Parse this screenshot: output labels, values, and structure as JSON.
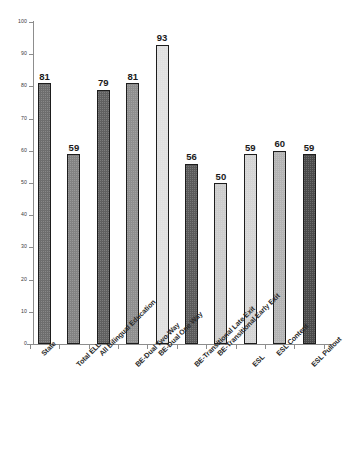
{
  "chart_data": {
    "type": "bar",
    "title": "",
    "subtitle": "",
    "xlabel": "",
    "ylabel": "",
    "ylim": [
      0,
      100
    ],
    "ytick_labels": [
      "100",
      "90",
      "80",
      "70",
      "60",
      "50",
      "40",
      "30",
      "20",
      "10",
      "0"
    ],
    "ytick_values": [
      100,
      90,
      80,
      70,
      60,
      50,
      40,
      30,
      20,
      10,
      0
    ],
    "grid": false,
    "legend": false,
    "categories": [
      "State",
      "Total ELL",
      "All Bilingual Education",
      "BE-Dual Two-Way",
      "BE-Dual One Way",
      "BE-Transitional Late Exit",
      "BE-Transitional Early Exit",
      "ESL",
      "ESL Content",
      "ESL Pullout"
    ],
    "values": [
      81,
      59,
      79,
      81,
      93,
      56,
      50,
      59,
      60,
      59
    ],
    "bar_colors": [
      "#6e6e6e",
      "#828282",
      "#606060",
      "#8e8e8e",
      "#e0e0e0",
      "#5a5a5a",
      "#cccccc",
      "#d4d4d4",
      "#b4b4b4",
      "#4a4a4a"
    ],
    "bar_edge_color": "#1d1d1d",
    "axis_color": "#8d8d8d",
    "background_color": "#ffffff"
  }
}
